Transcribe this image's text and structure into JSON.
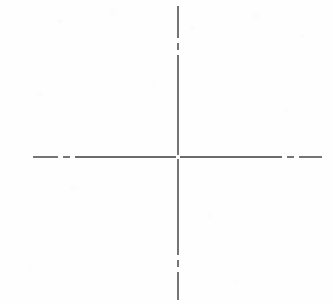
{
  "canvas": {
    "width": 332,
    "height": 304,
    "background_color": "#fefefe",
    "title": "Centerline Crosshair"
  },
  "graphic": {
    "name": "centerline-crosshair",
    "description": "Two intersecting dash-dot centerlines forming a crosshair / axis cross",
    "line_color": "#3a3a3a",
    "line_width": 1.4,
    "dash_style": "dash-dot",
    "center_point": {
      "x": 178,
      "y": 157
    },
    "center_gap": 3,
    "horizontal_line": {
      "name": "horizontal-centerline",
      "y": 157,
      "x_start": 33,
      "x_end": 322,
      "dash_array": "26 5 7 5",
      "segments": [
        {
          "from": 33,
          "to": 58
        },
        {
          "from": 63,
          "to": 70
        },
        {
          "from": 75,
          "to": 176
        },
        {
          "from": 180,
          "to": 282
        },
        {
          "from": 287,
          "to": 294
        },
        {
          "from": 299,
          "to": 322
        }
      ]
    },
    "vertical_line": {
      "name": "vertical-centerline",
      "x": 178,
      "y_start": 6,
      "y_end": 300,
      "dash_array": "32 5 7 5",
      "segments": [
        {
          "from": 6,
          "to": 38
        },
        {
          "from": 43,
          "to": 50
        },
        {
          "from": 55,
          "to": 155
        },
        {
          "from": 159,
          "to": 255
        },
        {
          "from": 260,
          "to": 267
        },
        {
          "from": 272,
          "to": 300
        }
      ]
    }
  }
}
